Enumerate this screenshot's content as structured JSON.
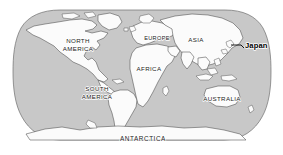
{
  "map": {
    "title": "World map with Japan highlighted",
    "projection": "robinson",
    "colors": {
      "ocean": "#c8c8c8",
      "land": "#fbfbfb",
      "coastline": "#4a4a4a",
      "globe_outline": "#6e6e6e",
      "background": "#ffffff",
      "label_text": "#1a1a1a",
      "highlight_text": "#000000"
    },
    "labels": {
      "north_america_line1": "NORTH",
      "north_america_line2": "AMERICA",
      "south_america_line1": "SOUTH",
      "south_america_line2": "AMERICA",
      "europe": "EUROPE",
      "africa": "AFRICA",
      "asia": "ASIA",
      "australia": "AUSTRALIA",
      "antarctica": "ANTARCTICA"
    },
    "callout": {
      "label": "Japan",
      "style": "bold-mixed-case",
      "leader_line": true
    }
  }
}
